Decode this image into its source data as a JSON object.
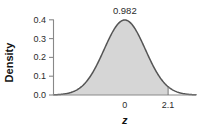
{
  "chart_data": {
    "type": "area",
    "title": "",
    "subtitle": "",
    "xlabel": "z",
    "ylabel": "Density",
    "xlim": [
      -3.45,
      3.45
    ],
    "ylim": [
      0.0,
      0.4
    ],
    "grid": false,
    "legend": null,
    "distribution": "standard normal density",
    "x_tick_labels": [
      "0",
      "2.1"
    ],
    "x_tick_values": [
      0,
      2.1
    ],
    "y_tick_labels": [
      "0.0",
      "0.1",
      "0.2",
      "0.3",
      "0.4"
    ],
    "y_tick_values": [
      0.0,
      0.1,
      0.2,
      0.3,
      0.4
    ],
    "annotations": [
      {
        "text": "0.982",
        "meaning": "shaded cumulative area to the left of z = 2.1",
        "x": 0,
        "y": 0.4
      }
    ],
    "shaded_region": {
      "from": "left tail",
      "to": 2.1,
      "area": 0.982,
      "boundary_line_x": 2.1
    },
    "series": [
      {
        "name": "Density",
        "x": [
          -3.45,
          -3.2,
          -3.0,
          -2.8,
          -2.6,
          -2.4,
          -2.2,
          -2.0,
          -1.8,
          -1.6,
          -1.4,
          -1.2,
          -1.0,
          -0.8,
          -0.6,
          -0.4,
          -0.2,
          0.0,
          0.2,
          0.4,
          0.6,
          0.8,
          1.0,
          1.2,
          1.4,
          1.6,
          1.8,
          2.0,
          2.1,
          2.2,
          2.4,
          2.6,
          2.8,
          3.0,
          3.2,
          3.45
        ],
        "values": [
          0.001,
          0.002,
          0.004,
          0.008,
          0.014,
          0.022,
          0.035,
          0.054,
          0.079,
          0.111,
          0.15,
          0.194,
          0.242,
          0.29,
          0.333,
          0.368,
          0.391,
          0.399,
          0.391,
          0.368,
          0.333,
          0.29,
          0.242,
          0.194,
          0.15,
          0.111,
          0.079,
          0.054,
          0.044,
          0.035,
          0.022,
          0.014,
          0.008,
          0.004,
          0.002,
          0.001
        ]
      }
    ],
    "colors": {
      "fill": "#d6d6d6",
      "curve": "#555555",
      "axis": "#808080",
      "text": "#2b2b2b",
      "background": "#ffffff"
    }
  }
}
